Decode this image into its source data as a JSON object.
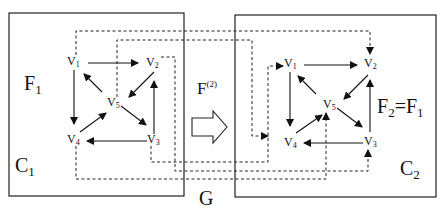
{
  "diagram": {
    "left_graph": {
      "container_label": "C1",
      "container_label_base": "C",
      "container_label_sub": "1",
      "function_label_base": "F",
      "function_label_sub": "1",
      "vertices": [
        {
          "id": "v1",
          "base": "V",
          "sub": "1"
        },
        {
          "id": "v2",
          "base": "V",
          "sub": "2"
        },
        {
          "id": "v3",
          "base": "V",
          "sub": "3"
        },
        {
          "id": "v4",
          "base": "V",
          "sub": "4"
        },
        {
          "id": "v5",
          "base": "V",
          "sub": "5"
        }
      ],
      "edges": [
        [
          "v1",
          "v2"
        ],
        [
          "v1",
          "v4"
        ],
        [
          "v2",
          "v5"
        ],
        [
          "v3",
          "v2"
        ],
        [
          "v3",
          "v4"
        ],
        [
          "v4",
          "v5"
        ],
        [
          "v5",
          "v1"
        ],
        [
          "v5",
          "v3"
        ]
      ]
    },
    "right_graph": {
      "container_label": "C2",
      "container_label_base": "C",
      "container_label_sub": "2",
      "function_label": "F2=F1",
      "function_label_parts": {
        "a_base": "F",
        "a_sub": "2",
        "eq": "=",
        "b_base": "F",
        "b_sub": "1"
      },
      "vertices": [
        {
          "id": "v1",
          "base": "V",
          "sub": "1"
        },
        {
          "id": "v2",
          "base": "V",
          "sub": "2"
        },
        {
          "id": "v3",
          "base": "V",
          "sub": "3"
        },
        {
          "id": "v4",
          "base": "V",
          "sub": "4"
        },
        {
          "id": "v5",
          "base": "V",
          "sub": "5"
        }
      ],
      "edges": [
        [
          "v1",
          "v2"
        ],
        [
          "v1",
          "v4"
        ],
        [
          "v2",
          "v5"
        ],
        [
          "v3",
          "v2"
        ],
        [
          "v3",
          "v4"
        ],
        [
          "v4",
          "v5"
        ],
        [
          "v5",
          "v1"
        ],
        [
          "v5",
          "v3"
        ]
      ]
    },
    "mapping_label_base": "F",
    "mapping_label_sup": "(2)",
    "mapping_edges_dashed": [
      [
        "left.v1",
        "right.v2"
      ],
      [
        "left.v5",
        "right.v4"
      ],
      [
        "left.v3",
        "right.v1"
      ],
      [
        "left.v2",
        "right.v3"
      ],
      [
        "left.v4",
        "right.v5"
      ]
    ],
    "outer_label": "G",
    "colors": {
      "ink": "#111111",
      "background": "#ffffff"
    }
  }
}
